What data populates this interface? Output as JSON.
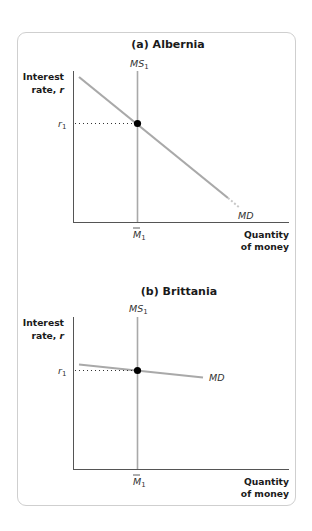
{
  "panels": [
    {
      "title": "(a) Albernia",
      "y_axis_label_line1": "Interest",
      "y_axis_label_line2": "rate, ",
      "y_axis_label_var": "r",
      "x_axis_label_line1": "Quantity",
      "x_axis_label_line2": "of money",
      "supply_curve_label": "MS",
      "supply_curve_sub": "1",
      "demand_curve_label": "MD",
      "rate_tick_label": "r",
      "rate_tick_sub": "1",
      "quantity_tick_label": "M",
      "quantity_tick_sub": "1",
      "demand_slope": "steep"
    },
    {
      "title": "(b) Brittania",
      "y_axis_label_line1": "Interest",
      "y_axis_label_line2": "rate, ",
      "y_axis_label_var": "r",
      "x_axis_label_line1": "Quantity",
      "x_axis_label_line2": "of money",
      "supply_curve_label": "MS",
      "supply_curve_sub": "1",
      "demand_curve_label": "MD",
      "rate_tick_label": "r",
      "rate_tick_sub": "1",
      "quantity_tick_label": "M",
      "quantity_tick_sub": "1",
      "demand_slope": "flat"
    }
  ],
  "colors": {
    "axis": "#555555",
    "curve": "#a9a9a9",
    "equilibrium_point": "#000000",
    "frame_border": "#cfcfcf"
  }
}
